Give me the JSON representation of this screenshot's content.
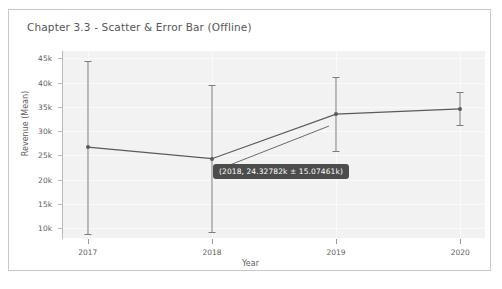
{
  "figure": {
    "title": "Chapter 3.3 - Scatter & Error Bar (Offline)"
  },
  "tooltip": {
    "text": "(2018, 24.32782k ± 15.07461k)"
  },
  "colors": {
    "plot_background": "#f2f2f2",
    "gridline": "#fafafa",
    "line": "#5a5a5a",
    "errorbar": "#7c7c7c",
    "axis": "#b8b8b8",
    "tick_text": "#5e5e5e",
    "title_text": "#565656",
    "tooltip_background": "#4c4c4c",
    "tooltip_text": "#ffffff",
    "frame_border": "#c9c9c9"
  },
  "chart_data": {
    "type": "line",
    "title": "Chapter 3.3 - Scatter & Error Bar (Offline)",
    "xlabel": "Year",
    "ylabel": "Revenue (Mean)",
    "x": [
      2017,
      2018,
      2019,
      2020
    ],
    "xtick_labels": [
      "2017",
      "2018",
      "2019",
      "2020"
    ],
    "ytick_labels": [
      "10k",
      "15k",
      "20k",
      "25k",
      "30k",
      "35k",
      "40k",
      "45k"
    ],
    "ytick_values": [
      10000,
      15000,
      20000,
      25000,
      30000,
      35000,
      40000,
      45000
    ],
    "ylim": [
      8000,
      46500
    ],
    "xlim": [
      2016.8,
      2020.2
    ],
    "grid": true,
    "legend": null,
    "series": [
      {
        "name": "Revenue (Mean)",
        "values": [
          26700,
          24327.82,
          33500,
          34600
        ],
        "errors": [
          17800,
          15074.61,
          7600,
          3400
        ],
        "error_display": "± error bars with caps"
      }
    ],
    "annotations": [
      {
        "type": "tooltip",
        "text": "(2018, 24.32782k ± 15.07461k)",
        "x": 2018,
        "y": 24327.82,
        "error": 15074.61
      }
    ]
  },
  "axes": {
    "y_ticks": [
      {
        "label": "45k",
        "value": 45000
      },
      {
        "label": "40k",
        "value": 40000
      },
      {
        "label": "35k",
        "value": 35000
      },
      {
        "label": "30k",
        "value": 30000
      },
      {
        "label": "25k",
        "value": 25000
      },
      {
        "label": "20k",
        "value": 20000
      },
      {
        "label": "15k",
        "value": 15000
      },
      {
        "label": "10k",
        "value": 10000
      }
    ],
    "x_ticks": [
      {
        "label": "2017",
        "value": 2017
      },
      {
        "label": "2018",
        "value": 2018
      },
      {
        "label": "2019",
        "value": 2019
      },
      {
        "label": "2020",
        "value": 2020
      }
    ],
    "x_title": "Year",
    "y_title": "Revenue (Mean)"
  }
}
